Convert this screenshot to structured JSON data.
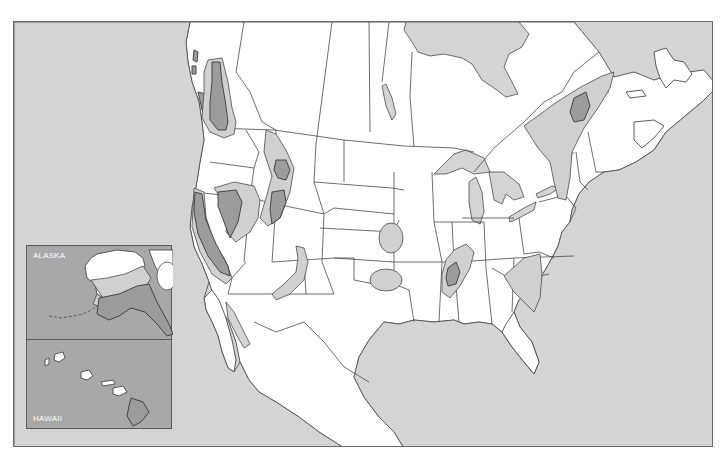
{
  "map": {
    "type": "thematic-region-map",
    "region": "North America",
    "legend_visible": false,
    "colors": {
      "ocean": "#d4d4d4",
      "land": "#ffffff",
      "zone_light": "#d0d0d0",
      "zone_dark": "#9c9c9c",
      "outline": "#4a4a4a",
      "inset_background": "#a8a8a8"
    },
    "zones": [
      {
        "name": "pacific-northwest-coast",
        "levels": [
          "light",
          "dark"
        ]
      },
      {
        "name": "california",
        "levels": [
          "light",
          "dark"
        ]
      },
      {
        "name": "nevada-great-basin",
        "levels": [
          "light",
          "dark"
        ]
      },
      {
        "name": "idaho-utah-wasatch",
        "levels": [
          "light",
          "dark"
        ]
      },
      {
        "name": "arizona-new-mexico",
        "levels": [
          "light"
        ]
      },
      {
        "name": "nebraska-kansas",
        "levels": [
          "light"
        ]
      },
      {
        "name": "oklahoma-texas",
        "levels": [
          "light"
        ]
      },
      {
        "name": "new-madrid",
        "levels": [
          "light",
          "dark"
        ]
      },
      {
        "name": "carolinas-appalachia",
        "levels": [
          "light"
        ]
      },
      {
        "name": "st-lawrence-new-england",
        "levels": [
          "light",
          "dark"
        ]
      }
    ]
  },
  "insets": {
    "alaska": {
      "label": "ALASKA"
    },
    "hawaii": {
      "label": "HAWAII"
    }
  }
}
